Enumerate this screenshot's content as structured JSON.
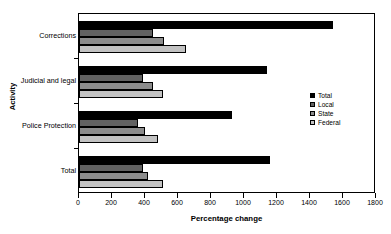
{
  "chart_data": {
    "type": "bar",
    "orientation": "horizontal",
    "title": "",
    "xlabel": "Percentage change",
    "ylabel": "Activity",
    "xlim": [
      0,
      1800
    ],
    "xticks": [
      0,
      200,
      400,
      600,
      800,
      1000,
      1200,
      1400,
      1600,
      1800
    ],
    "grid": false,
    "legend_position": "right-middle",
    "categories": [
      "Corrections",
      "Judicial and legal",
      "Police Protection",
      "Total"
    ],
    "series": [
      {
        "name": "Total",
        "color": "#000000",
        "values": [
          1540,
          1140,
          930,
          1160
        ]
      },
      {
        "name": "Local",
        "color": "#626262",
        "values": [
          450,
          390,
          360,
          390
        ]
      },
      {
        "name": "State",
        "color": "#8c8c8c",
        "values": [
          515,
          450,
          400,
          420
        ]
      },
      {
        "name": "Federal",
        "color": "#c2c2c2",
        "values": [
          650,
          510,
          480,
          510
        ]
      }
    ]
  },
  "axes": {
    "x_title": "Percentage change",
    "y_title": "Activity",
    "x_tick_labels": [
      "0",
      "200",
      "400",
      "600",
      "800",
      "1000",
      "1200",
      "1400",
      "1600",
      "1800"
    ],
    "y_tick_labels": [
      "Corrections",
      "Judicial and legal",
      "Police Protection",
      "Total"
    ]
  },
  "legend": {
    "items": [
      {
        "label": "Total",
        "color": "#000000"
      },
      {
        "label": "Local",
        "color": "#626262"
      },
      {
        "label": "State",
        "color": "#8c8c8c"
      },
      {
        "label": "Federal",
        "color": "#c2c2c2"
      }
    ]
  }
}
